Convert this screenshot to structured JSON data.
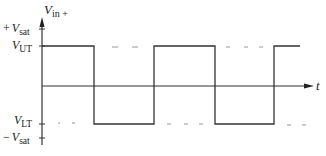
{
  "diagram": {
    "type": "square-wave-timing",
    "y_axis": {
      "label_main": "V",
      "label_sub": "in +",
      "direction": "up"
    },
    "x_axis": {
      "label": "t",
      "direction": "right"
    },
    "levels": {
      "plus_vsat": {
        "sign": "+",
        "main": "V",
        "sub": "sat"
      },
      "vut": {
        "main": "V",
        "sub": "UT"
      },
      "vlt": {
        "main": "V",
        "sub": "LT"
      },
      "minus_vsat": {
        "sign": "−",
        "main": "V",
        "sub": "sat"
      }
    },
    "waveform": {
      "description": "Square wave alternating between V_UT and V_LT",
      "segments": [
        {
          "level": "high",
          "x_start": 42,
          "x_end": 94
        },
        {
          "level": "low",
          "x_start": 94,
          "x_end": 154
        },
        {
          "level": "high",
          "x_start": 154,
          "x_end": 215
        },
        {
          "level": "low",
          "x_start": 215,
          "x_end": 274
        },
        {
          "level": "high",
          "x_start": 274,
          "x_end": 300
        }
      ]
    },
    "colors": {
      "line": "#333333",
      "dash": "#888888",
      "background": "#ffffff"
    }
  }
}
